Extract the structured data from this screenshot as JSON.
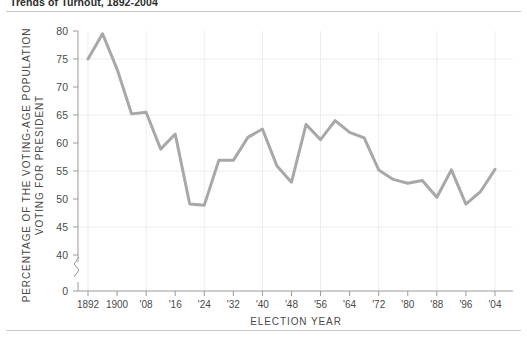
{
  "figure": {
    "title": "Trends of Turnout, 1892-2004"
  },
  "chart_data": {
    "type": "line",
    "title": "Trends of Turnout, 1892-2004",
    "xlabel": "ELECTION YEAR",
    "ylabel": "PERCENTAGE OF THE VOTING-AGE POPULATION VOTING FOR PRESIDENT",
    "ylabel_line1": "PERCENTAGE OF THE VOTING-AGE POPULATION",
    "ylabel_line2": "VOTING FOR PRESIDENT",
    "x": [
      1892,
      1896,
      1900,
      1904,
      1908,
      1912,
      1916,
      1920,
      1924,
      1928,
      1932,
      1936,
      1940,
      1944,
      1948,
      1952,
      1956,
      1960,
      1964,
      1968,
      1972,
      1976,
      1980,
      1984,
      1988,
      1992,
      1996,
      2000,
      2004
    ],
    "values": [
      75.0,
      79.5,
      73.2,
      65.2,
      65.5,
      58.9,
      61.6,
      49.1,
      48.9,
      56.9,
      56.9,
      61.0,
      62.5,
      55.9,
      53.0,
      63.3,
      60.6,
      64.0,
      61.9,
      60.9,
      55.2,
      53.5,
      52.8,
      53.3,
      50.3,
      55.2,
      49.1,
      51.3,
      55.3
    ],
    "ylim": [
      0,
      80
    ],
    "axis_break": true,
    "y_ticks": [
      "80",
      "75",
      "70",
      "65",
      "60",
      "55",
      "50",
      "45",
      "40",
      "0"
    ],
    "y_tick_values": [
      80,
      75,
      70,
      65,
      60,
      55,
      50,
      45,
      40,
      0
    ],
    "x_ticks": [
      "1892",
      "1900",
      "'08",
      "'16",
      "'24",
      "'32",
      "'40",
      "'48",
      "'56",
      "'64",
      "'72",
      "'80",
      "'88",
      "'96",
      "'04"
    ],
    "x_tick_values": [
      1892,
      1900,
      1908,
      1916,
      1924,
      1932,
      1940,
      1948,
      1956,
      1964,
      1972,
      1980,
      1988,
      1996,
      2004
    ],
    "grid": true,
    "grid_axis": "both",
    "legend": false,
    "series_color": "#a8a8a8"
  }
}
